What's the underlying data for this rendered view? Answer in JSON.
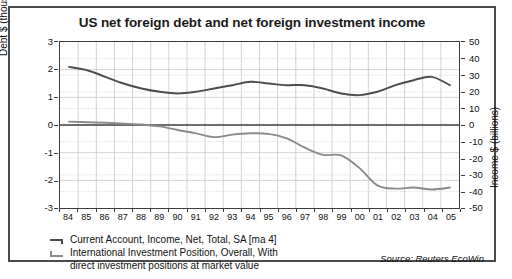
{
  "chart_data": {
    "type": "line",
    "title": "US net foreign debt and net foreign investment income",
    "xlabel": "",
    "ylabel": "Debt $ (thousand billions)",
    "ylabel_right": "Income $ (billions)",
    "ylim": [
      -3,
      3
    ],
    "ylim_right": [
      -50,
      50
    ],
    "yticks": [
      "3",
      "2",
      "1",
      "0",
      "-1",
      "-2",
      "-3"
    ],
    "yticks_right": [
      "50",
      "40",
      "30",
      "20",
      "10",
      "0",
      "-10",
      "-20",
      "-30",
      "-40",
      "-50"
    ],
    "grid": true,
    "legend_position": "below-left",
    "source": "Source: Reuters EcoWin",
    "xticks": [
      "84",
      "85",
      "86",
      "87",
      "88",
      "89",
      "90",
      "91",
      "92",
      "93",
      "94",
      "95",
      "96",
      "97",
      "98",
      "99",
      "00",
      "01",
      "02",
      "03",
      "04",
      "05"
    ],
    "x": [
      1984,
      1985,
      1986,
      1987,
      1988,
      1989,
      1990,
      1991,
      1992,
      1993,
      1994,
      1995,
      1996,
      1997,
      1998,
      1999,
      2000,
      2001,
      2002,
      2003,
      2004,
      2005
    ],
    "series": [
      {
        "name": "Current Account, Income, Net, Total, SA [ma 4]",
        "axis": "right",
        "units": "billions",
        "color": "#4d4d4d",
        "values": [
          35,
          33,
          29,
          25,
          22,
          20,
          19,
          20,
          22,
          24,
          26,
          25,
          24,
          24,
          22,
          19,
          18,
          20,
          24,
          27,
          29,
          24
        ]
      },
      {
        "name": "International Investment Position, Overall, With direct investment positions at market value",
        "axis": "left",
        "units": "thousand billions",
        "color": "#8a8a8a",
        "values": [
          0.12,
          0.1,
          0.08,
          0.05,
          0.02,
          -0.05,
          -0.18,
          -0.3,
          -0.44,
          -0.35,
          -0.3,
          -0.32,
          -0.48,
          -0.82,
          -1.08,
          -1.1,
          -1.55,
          -2.18,
          -2.3,
          -2.26,
          -2.33,
          -2.26
        ]
      }
    ]
  },
  "legend": {
    "item1": "Current Account, Income, Net, Total, SA [ma 4]",
    "item2_line1": "International Investment Position, Overall, With",
    "item2_line2": "direct investment positions at market value"
  },
  "axes": {
    "left_title": "Debt $ (thousand billions)",
    "right_title": "Income $ (billions)"
  }
}
